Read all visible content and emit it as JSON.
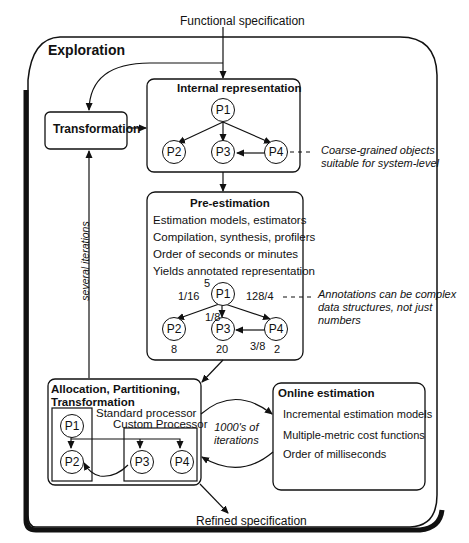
{
  "labels": {
    "functional_specification": "Functional specification",
    "refined_specification": "Refined specification",
    "exploration": "Exploration",
    "transformation": "Transformation",
    "several_iterations": "several iterations",
    "thousands_iterations_line1": "1000's of",
    "thousands_iterations_line2": "iterations"
  },
  "internal_representation": {
    "title": "Internal representation",
    "nodes": [
      "P1",
      "P2",
      "P3",
      "P4"
    ],
    "note_line1": "Coarse-grained objects",
    "note_line2": "suitable for system-level"
  },
  "pre_estimation": {
    "title": "Pre-estimation",
    "lines": [
      "Estimation models,  estimators",
      "Compilation, synthesis,  profilers",
      "Order of seconds or  minutes",
      "Yields annotated representation"
    ],
    "nodes": [
      "P1",
      "P2",
      "P3",
      "P4"
    ],
    "annotations": {
      "p1_value": "5",
      "p1_p2_edge": "1/16",
      "p1_p3_edge": "1/8",
      "p1_p4_edge": "128/4",
      "p4_p3_edge": "3/8",
      "p2_value": "8",
      "p3_value": "20",
      "p4_value": "2"
    },
    "note_line1": "Annotations can be complex",
    "note_line2": "data structures, not just",
    "note_line3": "numbers"
  },
  "allocation": {
    "title_line1": "Allocation, Partitioning,",
    "title_line2": "Transformation",
    "standard_processor": "Standard processor",
    "custom_processor": "Custom Processor",
    "nodes": [
      "P1",
      "P2",
      "P3",
      "P4"
    ]
  },
  "online_estimation": {
    "title": "Online estimation",
    "lines": [
      "Incremental estimation models",
      "Multiple-metric cost functions",
      "Order of milliseconds"
    ]
  }
}
